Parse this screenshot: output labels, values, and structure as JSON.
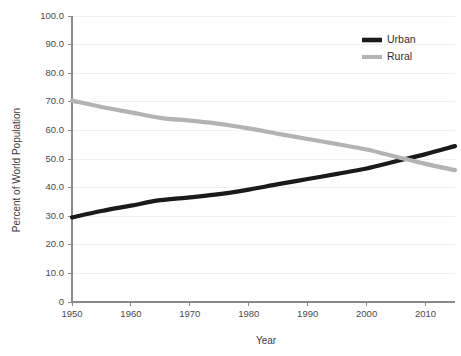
{
  "chart_data": {
    "type": "line",
    "title": "",
    "xlabel": "Year",
    "ylabel": "Percent of World Population",
    "xlim": [
      1950,
      2015
    ],
    "ylim": [
      0,
      100
    ],
    "grid": true,
    "legend_position": "top-right",
    "xticks": [
      1950,
      1960,
      1970,
      1980,
      1990,
      2000,
      2010
    ],
    "xtick_labels": [
      "1950",
      "1960",
      "1970",
      "1980",
      "1990",
      "2000",
      "2010"
    ],
    "yticks": [
      0,
      10,
      20,
      30,
      40,
      50,
      60,
      70,
      80,
      90,
      100
    ],
    "ytick_labels": [
      "0",
      "10.0",
      "20.0",
      "30.0",
      "40.0",
      "50.0",
      "60.0",
      "70.0",
      "80.0",
      "90.0",
      "100.0"
    ],
    "x": [
      1950,
      1955,
      1960,
      1965,
      1970,
      1975,
      1980,
      1985,
      1990,
      1995,
      2000,
      2005,
      2010,
      2015
    ],
    "series": [
      {
        "name": "Urban",
        "color": "#1a1a1a",
        "values": [
          29.6,
          31.8,
          33.7,
          35.6,
          36.6,
          37.7,
          39.3,
          41.2,
          43.0,
          44.8,
          46.7,
          49.2,
          51.7,
          54.5
        ]
      },
      {
        "name": "Rural",
        "color": "#b3b3b3",
        "values": [
          70.4,
          68.2,
          66.3,
          64.4,
          63.4,
          62.3,
          60.7,
          58.8,
          57.0,
          55.2,
          53.3,
          50.8,
          48.3,
          46.1
        ]
      }
    ],
    "annotations": []
  },
  "legend": {
    "items": [
      {
        "label": "Urban",
        "color": "#1a1a1a",
        "swatch": "line-swatch"
      },
      {
        "label": "Rural",
        "color": "#b3b3b3",
        "swatch": "line-swatch"
      }
    ]
  },
  "axes": {
    "x_title": "Year",
    "y_title": "Percent of World Population"
  },
  "colors": {
    "background": "#ffffff",
    "axis": "#8a8a8a",
    "grid": "#f0f0f0",
    "text": "#3a3a3a",
    "urban": "#1a1a1a",
    "rural": "#b3b3b3"
  }
}
